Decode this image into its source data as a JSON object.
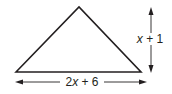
{
  "diagram": {
    "shape": "triangle",
    "base_label": {
      "text_parts": [
        "2",
        "x",
        " + 6"
      ],
      "full": "2x + 6"
    },
    "height_label": {
      "text_parts": [
        "x",
        " + 1"
      ],
      "full": "x + 1"
    },
    "colors": {
      "stroke": "#231f20",
      "background": "#ffffff"
    }
  }
}
